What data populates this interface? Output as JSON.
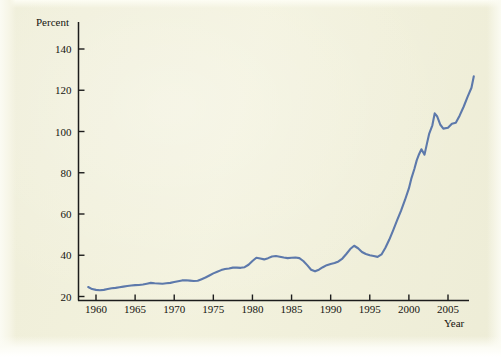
{
  "figure": {
    "background_color": "#f2f1dc",
    "line_color": "#5d79ab",
    "axis_color": "#1c1c1c"
  },
  "chart_data": {
    "type": "line",
    "title": "",
    "subtitle": "",
    "xlabel": "Year",
    "ylabel": "Percent",
    "ylabel_position": "top-left",
    "xlabel_position": "bottom-right",
    "grid": false,
    "legend": false,
    "legend_position": "none",
    "xlim": [
      1959,
      2008.5
    ],
    "ylim": [
      20,
      148
    ],
    "xticks": [
      1960,
      1965,
      1970,
      1975,
      1980,
      1985,
      1990,
      1995,
      2000,
      2005
    ],
    "xticklabels": [
      "1960",
      "1965",
      "1970",
      "1975",
      "1980",
      "1985",
      "1990",
      "1995",
      "2000",
      "2005"
    ],
    "yticks": [
      20,
      40,
      60,
      80,
      100,
      120,
      140
    ],
    "yticklabels": [
      "20",
      "40",
      "60",
      "80",
      "100",
      "120",
      "140"
    ],
    "series": [
      {
        "name": "Percent",
        "color": "#5d79ab",
        "x": [
          1959,
          1959.5,
          1960,
          1960.5,
          1961,
          1961.5,
          1962,
          1962.5,
          1963,
          1963.5,
          1964,
          1964.5,
          1965,
          1965.5,
          1966,
          1966.5,
          1967,
          1967.5,
          1968,
          1968.5,
          1969,
          1969.5,
          1970,
          1970.5,
          1971,
          1971.5,
          1972,
          1972.5,
          1973,
          1973.5,
          1974,
          1974.5,
          1975,
          1975.5,
          1976,
          1976.5,
          1977,
          1977.5,
          1978,
          1978.5,
          1979,
          1979.5,
          1980,
          1980.5,
          1981,
          1981.5,
          1982,
          1982.5,
          1983,
          1983.5,
          1984,
          1984.5,
          1985,
          1985.5,
          1986,
          1986.5,
          1987,
          1987.5,
          1988,
          1988.5,
          1989,
          1989.5,
          1990,
          1990.5,
          1991,
          1991.5,
          1992,
          1992.5,
          1993,
          1993.5,
          1994,
          1994.5,
          1995,
          1995.5,
          1996,
          1996.5,
          1997,
          1997.5,
          1998,
          1998.5,
          1999,
          1999.5,
          2000,
          2000.3,
          2000.7,
          2001,
          2001.3,
          2001.6,
          2002,
          2002.3,
          2002.6,
          2003,
          2003.3,
          2003.6,
          2004,
          2004.4,
          2005,
          2005.5,
          2006,
          2006.5,
          2007,
          2007.5,
          2008,
          2008.3
        ],
        "y": [
          24.6,
          23.6,
          23.2,
          23.0,
          23.2,
          23.6,
          24.0,
          24.2,
          24.5,
          24.8,
          25.1,
          25.3,
          25.5,
          25.6,
          25.8,
          26.2,
          26.6,
          26.4,
          26.3,
          26.2,
          26.4,
          26.6,
          27.0,
          27.4,
          27.8,
          27.9,
          27.7,
          27.5,
          27.6,
          28.4,
          29.2,
          30.2,
          31.2,
          32.0,
          32.8,
          33.3,
          33.6,
          34.0,
          34.0,
          33.9,
          34.2,
          35.4,
          37.2,
          38.8,
          38.4,
          38.0,
          38.6,
          39.4,
          39.6,
          39.3,
          38.9,
          38.6,
          38.8,
          38.9,
          38.6,
          37.2,
          35.2,
          33.0,
          32.2,
          33.0,
          34.2,
          35.2,
          35.8,
          36.2,
          37.0,
          38.4,
          40.6,
          43.0,
          44.6,
          43.4,
          41.6,
          40.6,
          40.0,
          39.6,
          39.2,
          40.4,
          43.6,
          47.6,
          52.2,
          57.0,
          61.6,
          66.8,
          72.4,
          77.0,
          81.8,
          86.0,
          89.0,
          91.4,
          88.8,
          94.0,
          99.0,
          103.0,
          108.8,
          107.4,
          103.4,
          101.4,
          101.8,
          103.8,
          104.2,
          107.8,
          112.0,
          116.8,
          121.2,
          126.8
        ]
      }
    ]
  }
}
